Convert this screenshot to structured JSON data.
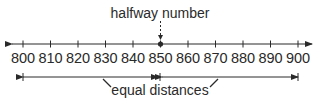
{
  "diagram": {
    "type": "number-line",
    "halfway_label": "halfway number",
    "equal_label": "equal distances",
    "min": 800,
    "max": 900,
    "step": 10,
    "halfway_value": 850,
    "ticks": [
      "800",
      "810",
      "820",
      "830",
      "840",
      "850",
      "860",
      "870",
      "880",
      "890",
      "900"
    ],
    "colors": {
      "line": "#2a2a2a",
      "background": "#ffffff"
    }
  }
}
